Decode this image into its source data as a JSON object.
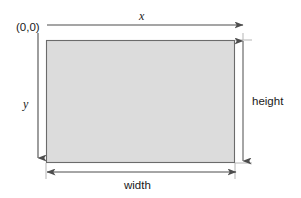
{
  "figure": {
    "type": "coordinate-system-rectangle-diagram",
    "canvas": {
      "width": 301,
      "height": 198,
      "background": "#ffffff"
    },
    "labels": {
      "origin": "(0,0)",
      "x_axis": "x",
      "y_axis": "y",
      "height": "height",
      "width": "width"
    },
    "rectangle": {
      "left": 46,
      "top": 40,
      "right": 235,
      "bottom": 163,
      "width": 189,
      "height": 123,
      "fill": "#dcdcdc",
      "stroke": "#555555"
    },
    "axes": {
      "x": {
        "y": 25,
        "from_x": 47,
        "to_x": 245,
        "arrow": "right",
        "stroke": "#4d4d4d"
      },
      "y": {
        "x": 38,
        "from_y": 33,
        "to_y": 160,
        "arrow": "down",
        "stroke": "#4d4d4d"
      }
    },
    "dimension_arrows": {
      "height": {
        "x": 243,
        "from_y": 40,
        "to_y": 161,
        "arrow": "both",
        "stroke": "#4d4d4d"
      },
      "width": {
        "y": 172,
        "from_x": 46,
        "to_x": 237,
        "arrow": "both",
        "stroke": "#4d4d4d"
      }
    },
    "guides": {
      "top_extension": {
        "y": 40,
        "from_x": 235,
        "to_x": 252
      },
      "bottom_extension": {
        "y": 163,
        "from_x": 235,
        "to_x": 252
      },
      "left_drop": {
        "x": 46,
        "from_y": 163,
        "to_y": 178
      },
      "right_drop": {
        "x": 235,
        "from_y": 163,
        "to_y": 178
      }
    }
  }
}
